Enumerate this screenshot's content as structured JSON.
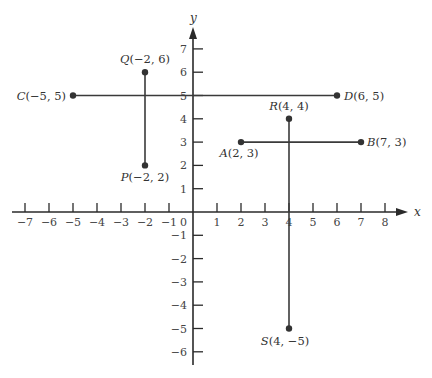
{
  "chart_data": {
    "type": "scatter",
    "title": "",
    "xlabel": "x",
    "ylabel": "y",
    "xlim": [
      -7,
      8
    ],
    "ylim": [
      -6,
      7
    ],
    "grid": false,
    "x_ticks": [
      -7,
      -6,
      -5,
      -4,
      -3,
      -2,
      -1,
      0,
      1,
      2,
      3,
      4,
      5,
      6,
      7,
      8
    ],
    "y_ticks": [
      -6,
      -5,
      -4,
      -3,
      -2,
      -1,
      1,
      2,
      3,
      4,
      5,
      6,
      7
    ],
    "points": [
      {
        "name": "A",
        "x": 2,
        "y": 3,
        "label": "A(2, 3)"
      },
      {
        "name": "B",
        "x": 7,
        "y": 3,
        "label": "B(7, 3)"
      },
      {
        "name": "C",
        "x": -5,
        "y": 5,
        "label": "C(−5, 5)"
      },
      {
        "name": "D",
        "x": 6,
        "y": 5,
        "label": "D(6, 5)"
      },
      {
        "name": "P",
        "x": -2,
        "y": 2,
        "label": "P(−2, 2)"
      },
      {
        "name": "Q",
        "x": -2,
        "y": 6,
        "label": "Q(−2, 6)"
      },
      {
        "name": "R",
        "x": 4,
        "y": 4,
        "label": "R(4, 4)"
      },
      {
        "name": "S",
        "x": 4,
        "y": -5,
        "label": "S(4, −5)"
      }
    ],
    "segments": [
      {
        "from": "A",
        "to": "B"
      },
      {
        "from": "C",
        "to": "D"
      },
      {
        "from": "P",
        "to": "Q"
      },
      {
        "from": "R",
        "to": "S"
      }
    ]
  },
  "axes": {
    "x_label": "x",
    "y_label": "y"
  },
  "colors": {
    "ink": "#333333",
    "background": "#ffffff"
  }
}
